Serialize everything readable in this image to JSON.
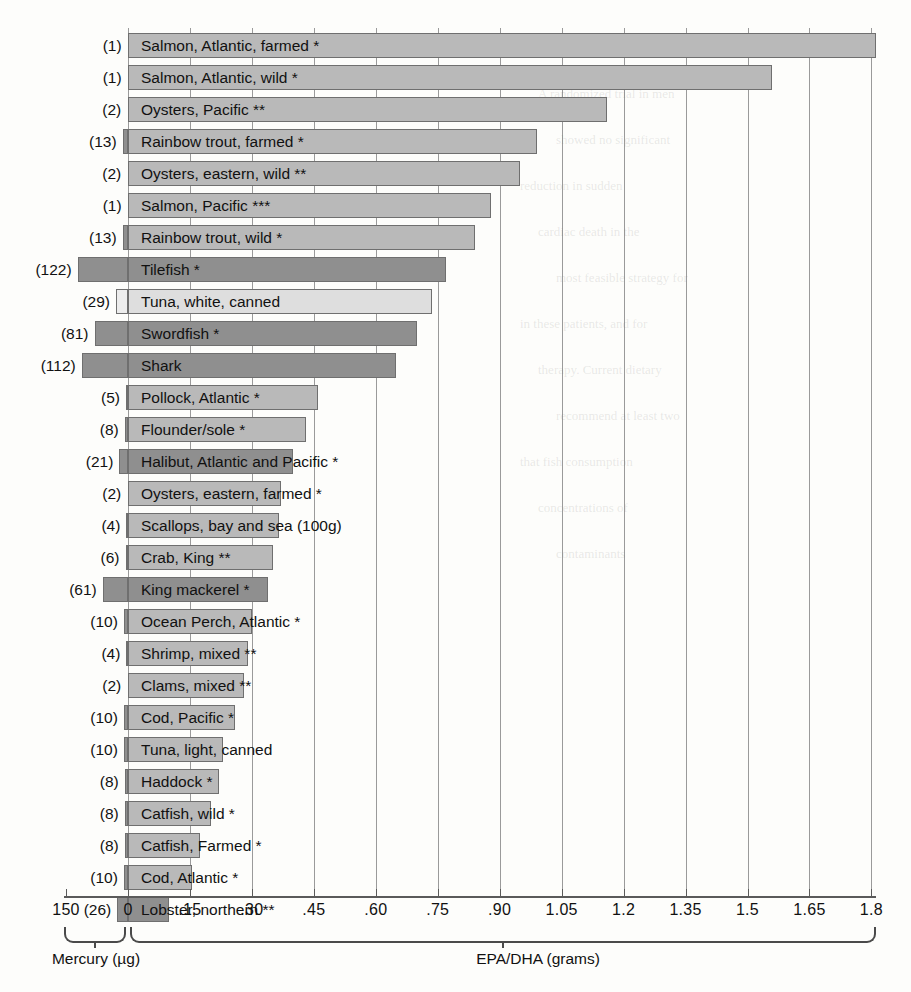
{
  "chart_data": {
    "type": "bar",
    "title": "",
    "subtitle": "",
    "orientation": "horizontal",
    "xlabel_left": "Mercury (µg)",
    "xlabel_right": "EPA/DHA (grams)",
    "ylabel": "",
    "grid": true,
    "legend": null,
    "zero_position_px": 128,
    "left_axis": {
      "label": "Mercury (µg)",
      "ticks": [
        "150",
        "0"
      ],
      "range": [
        150,
        0
      ],
      "units": "micrograms"
    },
    "right_axis": {
      "label": "EPA/DHA (grams)",
      "ticks": [
        "0",
        ".15",
        ".30",
        ".45",
        ".60",
        ".75",
        ".90",
        "1.05",
        "1.2",
        "1.35",
        "1.5",
        "1.65",
        "1.8"
      ],
      "range": [
        0,
        1.8
      ],
      "units": "grams"
    },
    "categories": [
      "Salmon, Atlantic, farmed *",
      "Salmon, Atlantic, wild *",
      "Oysters, Pacific **",
      "Rainbow trout, farmed *",
      "Oysters, eastern, wild **",
      "Salmon, Pacific ***",
      "Rainbow trout, wild *",
      "Tilefish *",
      "Tuna, white, canned",
      "Swordfish *",
      "Shark",
      "Pollock, Atlantic *",
      "Flounder/sole *",
      "Halibut, Atlantic and Pacific *",
      "Oysters, eastern, farmed *",
      "Scallops, bay and sea (100g)",
      "Crab, King **",
      "King mackerel *",
      "Ocean Perch, Atlantic *",
      "Shrimp, mixed **",
      "Clams, mixed **",
      "Cod, Pacific *",
      "Tuna, light, canned",
      "Haddock *",
      "Catfish, wild *",
      "Catfish, Farmed *",
      "Cod, Atlantic *",
      "Lobster, northern **"
    ],
    "series": [
      {
        "name": "EPA/DHA (grams)",
        "values": [
          1.81,
          1.56,
          1.16,
          0.99,
          0.95,
          0.88,
          0.84,
          0.77,
          0.735,
          0.7,
          0.65,
          0.46,
          0.43,
          0.4,
          0.37,
          0.365,
          0.35,
          0.34,
          0.3,
          0.29,
          0.28,
          0.26,
          0.23,
          0.22,
          0.2,
          0.175,
          0.155,
          0.1
        ]
      },
      {
        "name": "Mercury (µg)",
        "values": [
          1,
          1,
          2,
          13,
          2,
          1,
          13,
          122,
          29,
          81,
          112,
          5,
          8,
          21,
          2,
          4,
          6,
          61,
          10,
          4,
          2,
          10,
          10,
          8,
          8,
          8,
          10,
          26
        ]
      }
    ],
    "mercury_labels": [
      "(1)",
      "(1)",
      "(2)",
      "(13)",
      "(2)",
      "(1)",
      "(13)",
      "(122)",
      "(29)",
      "(81)",
      "(112)",
      "(5)",
      "(8)",
      "(21)",
      "(2)",
      "(4)",
      "(6)",
      "(61)",
      "(10)",
      "(4)",
      "(2)",
      "(10)",
      "(10)",
      "(8)",
      "(8)",
      "(8)",
      "(10)",
      "(26)"
    ],
    "notes": {
      "star_1": "*",
      "star_2": "**",
      "star_3": "***"
    }
  },
  "background_text": [
    "the rest of the page",
    "A randomized trial in men",
    "showed no significant",
    "reduction in sudden",
    "cardiac death in the",
    "most feasible strategy for",
    "in these patients, and for",
    "therapy. Current dietary",
    "recommend at least two",
    "that fish consumption",
    "concentrations of",
    "contaminants"
  ]
}
